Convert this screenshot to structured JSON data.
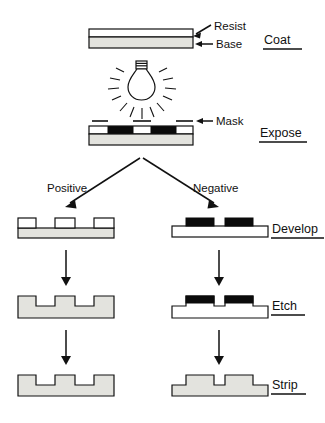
{
  "diagram": {
    "colors": {
      "ink": "#111111",
      "base_fill": "#e3e3de",
      "resist_exposed": "#0b0b0b",
      "resist_clear": "#ffffff",
      "background": "#ffffff"
    },
    "part_labels": [
      {
        "id": "resist",
        "text": "Resist",
        "arrow": "diagonal"
      },
      {
        "id": "base",
        "text": "Base",
        "arrow": "horizontal"
      },
      {
        "id": "mask",
        "text": "Mask",
        "arrow": "horizontal"
      }
    ],
    "branch_labels": [
      {
        "id": "positive",
        "text": "Positive",
        "side": "left"
      },
      {
        "id": "negative",
        "text": "Negative",
        "side": "right"
      }
    ],
    "steps": [
      {
        "id": "coat",
        "label": "Coat",
        "underlined": true
      },
      {
        "id": "expose",
        "label": "Expose",
        "underlined": true
      },
      {
        "id": "develop",
        "label": "Develop",
        "underlined": true
      },
      {
        "id": "etch",
        "label": "Etch",
        "underlined": true
      },
      {
        "id": "strip",
        "label": "Strip",
        "underlined": true
      }
    ],
    "light_source": {
      "id": "lightbulb",
      "rays": 14
    }
  }
}
